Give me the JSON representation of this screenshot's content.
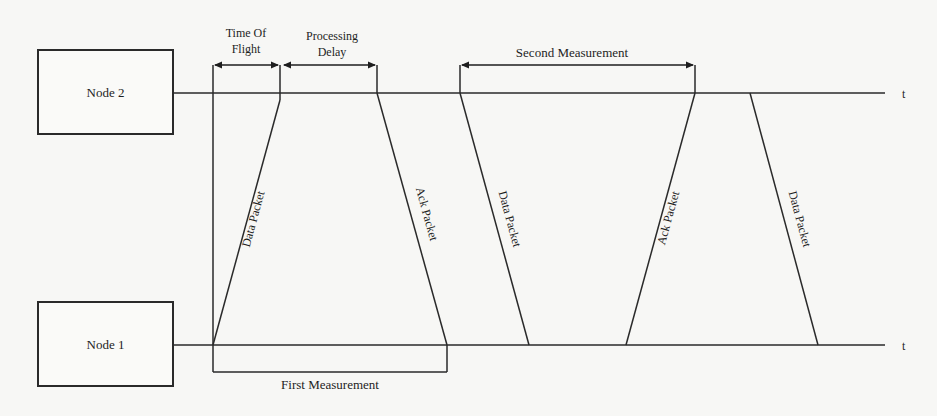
{
  "nodes": {
    "node2": {
      "label": "Node 2",
      "time_axis_label": "t"
    },
    "node1": {
      "label": "Node 1",
      "time_axis_label": "t"
    }
  },
  "intervals": {
    "time_of_flight": {
      "line1": "Time Of",
      "line2": "Flight"
    },
    "processing_delay": {
      "line1": "Processing",
      "line2": "Delay"
    },
    "second_measurement": {
      "label": "Second Measurement"
    },
    "first_measurement": {
      "label": "First Measurement"
    }
  },
  "packets": [
    {
      "label": "Data Packet",
      "from": "Node 1",
      "to": "Node 2"
    },
    {
      "label": "Ack Packet",
      "from": "Node 2",
      "to": "Node 1"
    },
    {
      "label": "Data Packet",
      "from": "Node 2",
      "to": "Node 1"
    },
    {
      "label": "Ack Packet",
      "from": "Node 1",
      "to": "Node 2"
    },
    {
      "label": "Data Packet",
      "from": "Node 2",
      "to": "Node 1"
    }
  ],
  "colors": {
    "background": "#f7f7f5",
    "ink": "#1e1e1e"
  }
}
